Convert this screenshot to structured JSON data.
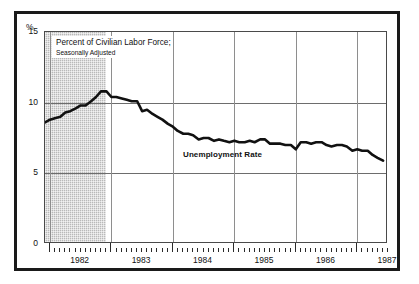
{
  "figure": {
    "callout_line1": "Percent of Civilian Labor Force;",
    "callout_line2": "Seasonally Adjusted",
    "series_label": "Unemployment Rate",
    "percent_symbol": "%"
  },
  "colors": {
    "line": "#111111",
    "recession_band": "#b9b9b9",
    "gridline": "#6d6d6d",
    "frame": "#1a1a1a",
    "background": "#ffffff"
  },
  "chart_data": {
    "type": "line",
    "title": "Percent of Civilian Labor Force; Seasonally Adjusted",
    "subtitle": "Seasonally Adjusted",
    "xlabel": "",
    "ylabel": "%",
    "ylim": [
      0,
      15
    ],
    "yticks": [
      0,
      5,
      10,
      15
    ],
    "ytick_labels": [
      "0",
      "5",
      "10",
      "15"
    ],
    "xlim": [
      1981.92,
      1987.5
    ],
    "xticks": [
      1982,
      1983,
      1984,
      1985,
      1986,
      1987
    ],
    "xtick_labels": [
      "1982",
      "1983",
      "1984",
      "1985",
      "1986",
      "1987"
    ],
    "minor_xticks": "monthly",
    "grid": "horizontal at 5 and 10; vertical at year marks",
    "legend": "inline annotation",
    "annotations": [
      {
        "text": "Unemployment Rate",
        "x": 1984.55,
        "y": 6.6
      }
    ],
    "shaded_regions": [
      {
        "label": "recession",
        "x_start": 1981.92,
        "x_end": 1982.92,
        "color": "#b9b9b9"
      }
    ],
    "series": [
      {
        "name": "Unemployment Rate",
        "units": "percent",
        "x": [
          1981.92,
          1982.0,
          1982.08,
          1982.17,
          1982.25,
          1982.33,
          1982.42,
          1982.5,
          1982.58,
          1982.67,
          1982.75,
          1982.83,
          1982.92,
          1983.0,
          1983.08,
          1983.17,
          1983.25,
          1983.33,
          1983.42,
          1983.5,
          1983.58,
          1983.67,
          1983.75,
          1983.83,
          1983.92,
          1984.0,
          1984.08,
          1984.17,
          1984.25,
          1984.33,
          1984.42,
          1984.5,
          1984.58,
          1984.67,
          1984.75,
          1984.83,
          1984.92,
          1985.0,
          1985.08,
          1985.17,
          1985.25,
          1985.33,
          1985.42,
          1985.5,
          1985.58,
          1985.67,
          1985.75,
          1985.83,
          1985.92,
          1986.0,
          1986.08,
          1986.17,
          1986.25,
          1986.33,
          1986.42,
          1986.5,
          1986.58,
          1986.67,
          1986.75,
          1986.83,
          1986.92,
          1987.0,
          1987.08,
          1987.17,
          1987.25,
          1987.33,
          1987.42
        ],
        "values": [
          8.6,
          8.8,
          8.9,
          9.0,
          9.3,
          9.4,
          9.6,
          9.8,
          9.8,
          10.1,
          10.4,
          10.8,
          10.8,
          10.4,
          10.4,
          10.3,
          10.2,
          10.1,
          10.1,
          9.4,
          9.5,
          9.2,
          9.0,
          8.8,
          8.5,
          8.3,
          8.0,
          7.8,
          7.8,
          7.7,
          7.4,
          7.5,
          7.5,
          7.3,
          7.4,
          7.3,
          7.2,
          7.3,
          7.2,
          7.2,
          7.3,
          7.2,
          7.4,
          7.4,
          7.1,
          7.1,
          7.1,
          7.0,
          7.0,
          6.7,
          7.2,
          7.2,
          7.1,
          7.2,
          7.2,
          7.0,
          6.9,
          7.0,
          7.0,
          6.9,
          6.6,
          6.7,
          6.6,
          6.6,
          6.3,
          6.1,
          5.9
        ]
      }
    ]
  }
}
